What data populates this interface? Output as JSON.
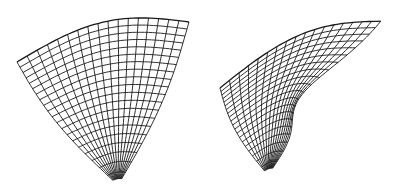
{
  "figure": {
    "stroke_color": "#1a1a1a",
    "background": "#ffffff",
    "surfaces": [
      {
        "name": "left-paraboloid",
        "u_lines": 17,
        "v_lines": 20,
        "corners": {
          "top_left": [
            17,
            62
          ],
          "top_right": [
            189,
            22
          ],
          "bottom": [
            118,
            185
          ]
        },
        "top_bulge": 22,
        "left_bulge": 10,
        "right_bulge": -8
      },
      {
        "name": "right-saddle-bowl",
        "u_lines": 17,
        "v_lines": 20,
        "corners": {
          "top_left": [
            220,
            88
          ],
          "top_right": [
            382,
            21
          ],
          "bottom": [
            268,
            175
          ]
        },
        "top_bulge": 20,
        "left_bulge": 8,
        "right_bulge": 30
      }
    ]
  }
}
